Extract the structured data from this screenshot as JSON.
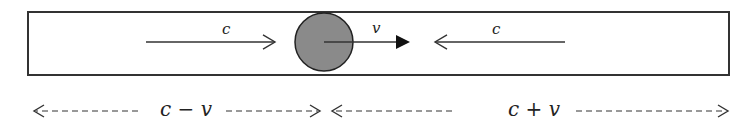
{
  "diagram": {
    "type": "relative-velocity-light-tube",
    "colors": {
      "stroke": "#333333",
      "ball_fill": "#8a8a8a",
      "background": "#ffffff"
    },
    "tube": {
      "x": 28,
      "y": 12,
      "width": 701,
      "height": 63
    },
    "ball": {
      "cx": 324,
      "cy": 42,
      "r": 29
    },
    "arrows_in_tube": [
      {
        "id": "light-left",
        "label": "c",
        "from_x": 146,
        "to_x": 275,
        "y": 42,
        "head": "open",
        "label_x": 222,
        "label_y": 34
      },
      {
        "id": "ball-velocity",
        "label": "v",
        "from_x": 324,
        "to_x": 410,
        "y": 42,
        "head": "filled",
        "label_x": 372,
        "label_y": 33
      },
      {
        "id": "light-right",
        "label": "c",
        "from_x": 565,
        "to_x": 435,
        "y": 42,
        "head": "open",
        "label_x": 492,
        "label_y": 34
      }
    ],
    "bottom_labels": [
      {
        "id": "left-segment",
        "text": "c − v",
        "x": 160,
        "y": 116
      },
      {
        "id": "right-segment",
        "text": "c + v",
        "x": 508,
        "y": 116
      }
    ],
    "bottom_dashed_arrows": [
      {
        "id": "left-seg-left",
        "from_x": 138,
        "to_x": 34,
        "y": 111
      },
      {
        "id": "left-seg-right",
        "from_x": 226,
        "to_x": 320,
        "y": 111
      },
      {
        "id": "right-seg-left",
        "from_x": 452,
        "to_x": 332,
        "y": 111
      },
      {
        "id": "right-seg-right",
        "from_x": 576,
        "to_x": 728,
        "y": 111
      }
    ]
  }
}
